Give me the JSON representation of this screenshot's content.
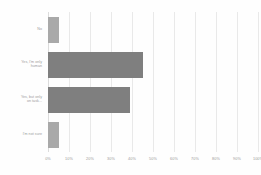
{
  "chart_data": {
    "type": "bar",
    "orientation": "horizontal",
    "title": "",
    "subtitle": "",
    "xlabel": "",
    "ylabel": "",
    "xlim": [
      0,
      100
    ],
    "xtick_labels": [
      "0%",
      "10%",
      "20%",
      "30%",
      "40%",
      "50%",
      "60%",
      "70%",
      "80%",
      "90%",
      "100%"
    ],
    "xtick_values": [
      0,
      10,
      20,
      30,
      40,
      50,
      60,
      70,
      80,
      90,
      100
    ],
    "grid": true,
    "grid_axis": "x",
    "legend": false,
    "legend_position": "none",
    "categories": [
      "No",
      "Yes, I'm only\nhuman",
      "Yes, but only\non task...",
      "I'm not sure"
    ],
    "values": [
      5,
      45,
      39,
      5
    ],
    "value_labels": [
      "5%",
      "45%",
      "39%",
      "5%"
    ],
    "bar_colors": [
      "#a9a9a9",
      "#7f7f7f",
      "#7f7f7f",
      "#a9a9a9"
    ]
  },
  "style": {
    "background": "#fefefe",
    "gridline_color": "#e9e9e9",
    "axis_color": "#dcdcdc",
    "text_color": "#9a9a9a"
  }
}
